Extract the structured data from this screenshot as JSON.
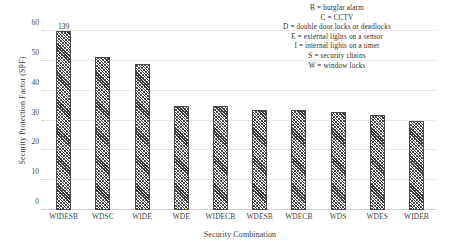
{
  "chart_data": {
    "type": "bar",
    "title": "",
    "xlabel": "Security Combination",
    "ylabel": "Security Protection Factor (SPF)",
    "categories": [
      "WIDESB",
      "WDSC",
      "WIDE",
      "WDE",
      "WIDECB",
      "WDESB",
      "WDECB",
      "WDS",
      "WDES",
      "WIDEB"
    ],
    "values": [
      60,
      51.3,
      49,
      35,
      35,
      33.5,
      33.5,
      33,
      32,
      30
    ],
    "point_labels": [
      "139",
      "",
      "",
      "",
      "",
      "",
      "",
      "",
      "",
      ""
    ],
    "ylim": [
      0,
      60
    ],
    "yticks": [
      0,
      10,
      20,
      30,
      40,
      50,
      60
    ],
    "grid": true,
    "legend_position": "top-right"
  },
  "legend": {
    "lines": [
      "B =  burglar alarm",
      "C = CCTV",
      "D = double door locks or deadlocks",
      "E = external lights on a sensor",
      "I = internal lights on a timer",
      "S = security chains",
      "W = window locks"
    ]
  }
}
